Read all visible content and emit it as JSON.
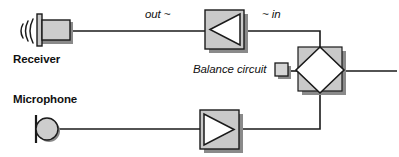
{
  "diagram": {
    "colors": {
      "line": "#1a1a1a",
      "box_fill": "#c9c9c9",
      "box_fill_light": "#d6d6d6",
      "shadow": "#8a8a8a",
      "white": "#ffffff",
      "text": "#111111"
    },
    "labels": {
      "receiver": "Receiver",
      "microphone": "Microphone",
      "out": "out ~",
      "in": "~ in",
      "balance_circuit": "Balance circuit"
    },
    "components": [
      {
        "name": "receiver-speaker",
        "type": "speaker",
        "label": "Receiver"
      },
      {
        "name": "receive-amplifier",
        "type": "amplifier",
        "direction": "left"
      },
      {
        "name": "hybrid-diamond",
        "type": "hybrid",
        "shape": "diamond-in-square"
      },
      {
        "name": "balance-circuit-box",
        "type": "box",
        "label": "Balance circuit"
      },
      {
        "name": "microphone-capsule",
        "type": "microphone",
        "label": "Microphone"
      },
      {
        "name": "transmit-amplifier",
        "type": "amplifier",
        "direction": "right"
      }
    ],
    "signals": [
      {
        "name": "out",
        "text": "out ~"
      },
      {
        "name": "in",
        "text": "~ in"
      }
    ]
  }
}
